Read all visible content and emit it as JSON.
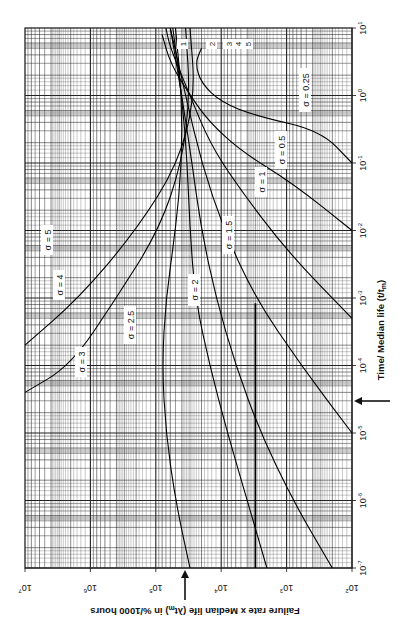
{
  "chart_data": {
    "type": "line",
    "orientation_note": "figure printed rotated 90 degrees clockwise",
    "title": "",
    "xlabel": "Time/ Median life (t/t_m)",
    "ylabel": "Failure rate x Median life (λt_m) in %/1000 hours",
    "x_scale": "log",
    "y_scale": "log",
    "xlim": [
      1e-07,
      10
    ],
    "ylim": [
      100,
      10000000.0
    ],
    "x_ticks": [
      "10^-7",
      "10^-6",
      "10^-5",
      "10^-4",
      "10^-3",
      "10^-2",
      "10^-1",
      "10^0",
      "10^1"
    ],
    "y_ticks": [
      "10^2",
      "10^3",
      "10^4",
      "10^5",
      "10^6",
      "10^7"
    ],
    "grid": true,
    "markers": [
      {
        "axis": "x",
        "value": 0.0005,
        "label": "arrow"
      },
      {
        "axis": "y",
        "value": 3000,
        "label": "arrow"
      }
    ],
    "series": [
      {
        "name": "σ = 0.25",
        "label": "σ = 0.25",
        "points": [
          [
            0.1,
            100
          ],
          [
            0.3,
            300
          ],
          [
            0.5,
            3000
          ],
          [
            0.8,
            10000
          ],
          [
            1.5,
            20000
          ],
          [
            3.0,
            25000
          ],
          [
            5.0,
            20000
          ]
        ]
      },
      {
        "name": "σ = 0.5",
        "label": "σ = 0.5",
        "points": [
          [
            0.01,
            100
          ],
          [
            0.05,
            800
          ],
          [
            0.15,
            5000
          ],
          [
            0.4,
            15000
          ],
          [
            1.0,
            30000
          ],
          [
            3.0,
            60000
          ],
          [
            8.0,
            80000
          ]
        ]
      },
      {
        "name": "σ = 1",
        "label": "σ = 1",
        "points": [
          [
            0.0005,
            100
          ],
          [
            0.005,
            1000
          ],
          [
            0.05,
            6000
          ],
          [
            0.2,
            15000
          ],
          [
            1.0,
            30000
          ],
          [
            5.0,
            60000
          ],
          [
            10,
            70000
          ]
        ]
      },
      {
        "name": "σ = 1.5",
        "label": "σ = 1.5",
        "points": [
          [
            1e-05,
            100
          ],
          [
            0.0001,
            600
          ],
          [
            0.001,
            3000
          ],
          [
            0.01,
            9000
          ],
          [
            0.1,
            20000
          ],
          [
            1.0,
            35000
          ],
          [
            10,
            60000
          ]
        ]
      },
      {
        "name": "σ = 2",
        "label": "σ = 2",
        "points": [
          [
            1e-07,
            200
          ],
          [
            1e-06,
            800
          ],
          [
            1e-05,
            2500
          ],
          [
            0.0001,
            6000
          ],
          [
            0.001,
            12000
          ],
          [
            0.01,
            20000
          ],
          [
            0.1,
            28000
          ],
          [
            1.0,
            40000
          ],
          [
            10,
            60000
          ]
        ]
      },
      {
        "name": "σ = 2.5",
        "label": "σ = 2.5",
        "points": [
          [
            1e-07,
            2000
          ],
          [
            1e-06,
            4000
          ],
          [
            1e-05,
            8000
          ],
          [
            0.0001,
            15000
          ],
          [
            0.001,
            25000
          ],
          [
            0.01,
            30000
          ],
          [
            0.1,
            33000
          ],
          [
            1.0,
            40000
          ],
          [
            10,
            55000
          ]
        ]
      },
      {
        "name": "σ = 3",
        "label": "σ = 3",
        "points": [
          [
            1e-07,
            30000
          ],
          [
            1e-06,
            50000
          ],
          [
            1e-05,
            70000
          ],
          [
            0.0001,
            80000
          ],
          [
            0.001,
            70000
          ],
          [
            0.01,
            50000
          ],
          [
            0.1,
            40000
          ],
          [
            1.0,
            40000
          ],
          [
            10,
            50000
          ]
        ]
      },
      {
        "name": "σ = 4",
        "label": "σ = 4",
        "points": [
          [
            4e-05,
            10000000.0
          ],
          [
            0.0001,
            2000000
          ],
          [
            0.001,
            400000
          ],
          [
            0.01,
            90000
          ],
          [
            0.1,
            40000
          ],
          [
            1.0,
            30000
          ],
          [
            10,
            35000
          ]
        ]
      },
      {
        "name": "σ = 5",
        "label": "σ = 5",
        "points": [
          [
            0.0002,
            10000000.0
          ],
          [
            0.001,
            1500000
          ],
          [
            0.01,
            200000
          ],
          [
            0.1,
            45000
          ],
          [
            1.0,
            25000
          ],
          [
            10,
            30000
          ]
        ]
      }
    ],
    "upper_right_labels": [
      "1",
      "2",
      "3",
      "4",
      "5"
    ]
  },
  "labels": {
    "x_axis": "Time/ Median life (t/t",
    "x_axis_sub": "m",
    "x_axis_end": ")",
    "y_axis": "Failure rate x Median life (λt",
    "y_axis_sub": "m",
    "y_axis_end": ") in %/1000 hours",
    "sigma_025": "σ = 0.25",
    "sigma_05": "σ = 0.5",
    "sigma_1": "σ = 1",
    "sigma_15": "σ = 1.5",
    "sigma_2": "σ = 2",
    "sigma_25": "σ = 2.5",
    "sigma_3": "σ = 3",
    "sigma_4": "σ = 4",
    "sigma_5": "σ = 5",
    "n1": "1",
    "n2": "2",
    "n3": "3",
    "n4": "4",
    "n5": "5"
  }
}
